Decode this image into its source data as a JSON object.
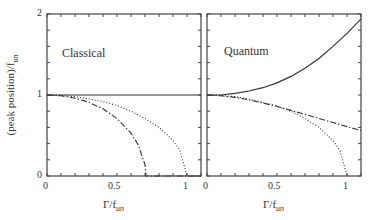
{
  "chart_data": [
    {
      "type": "line",
      "title": "Classical",
      "xlabel": "Γ/f_un",
      "ylabel": "(peak position)/f_un",
      "xlim": [
        0,
        1.1
      ],
      "ylim": [
        0,
        2
      ],
      "xticks": [
        "0",
        "0.5",
        "1"
      ],
      "yticks": [
        "0",
        "1",
        "2"
      ],
      "grid": false,
      "series": [
        {
          "name": "solid",
          "style": "solid",
          "x": [
            0,
            1.1
          ],
          "y": [
            1,
            1
          ]
        },
        {
          "name": "dash-dot",
          "style": "dashdot",
          "x": [
            0,
            0.1,
            0.2,
            0.3,
            0.4,
            0.5,
            0.6,
            0.65,
            0.7,
            0.707,
            1.1
          ],
          "y": [
            1,
            0.99,
            0.96,
            0.91,
            0.83,
            0.71,
            0.53,
            0.39,
            0.14,
            0,
            0
          ]
        },
        {
          "name": "dotted",
          "style": "dotted",
          "x": [
            0,
            0.1,
            0.2,
            0.3,
            0.4,
            0.5,
            0.6,
            0.7,
            0.8,
            0.9,
            0.95,
            1.0,
            1.1
          ],
          "y": [
            1,
            0.995,
            0.98,
            0.95,
            0.92,
            0.87,
            0.8,
            0.71,
            0.6,
            0.44,
            0.31,
            0,
            0
          ]
        }
      ]
    },
    {
      "type": "line",
      "title": "Quantum",
      "xlabel": "Γ/f_un",
      "ylabel": "",
      "xlim": [
        0,
        1.1
      ],
      "ylim": [
        0,
        2
      ],
      "xticks": [
        "0",
        "0.5",
        "1"
      ],
      "yticks": [],
      "grid": false,
      "series": [
        {
          "name": "solid",
          "style": "solid",
          "x": [
            0,
            0.1,
            0.2,
            0.3,
            0.4,
            0.5,
            0.6,
            0.7,
            0.8,
            0.9,
            1.0,
            1.1
          ],
          "y": [
            1,
            1.0,
            1.02,
            1.05,
            1.09,
            1.15,
            1.23,
            1.33,
            1.45,
            1.6,
            1.76,
            1.94
          ]
        },
        {
          "name": "dash-dot",
          "style": "dashdot",
          "x": [
            0,
            0.1,
            0.2,
            0.3,
            0.4,
            0.5,
            0.6,
            0.7,
            0.8,
            0.9,
            1.0,
            1.1
          ],
          "y": [
            1,
            0.99,
            0.97,
            0.94,
            0.9,
            0.86,
            0.81,
            0.76,
            0.71,
            0.66,
            0.61,
            0.56
          ]
        },
        {
          "name": "dotted",
          "style": "dotted",
          "x": [
            0,
            0.1,
            0.2,
            0.3,
            0.4,
            0.5,
            0.6,
            0.7,
            0.8,
            0.9,
            0.95,
            1.0
          ],
          "y": [
            1,
            0.995,
            0.98,
            0.95,
            0.91,
            0.86,
            0.8,
            0.71,
            0.6,
            0.44,
            0.31,
            0
          ]
        }
      ]
    }
  ],
  "labels": {
    "panel_left_title": "Classical",
    "panel_right_title": "Quantum",
    "ylabel_main": "(peak position)/f",
    "ylabel_sub": "un",
    "xlabel_main": "Γ/f",
    "xlabel_sub": "un",
    "ytick_0": "0",
    "ytick_1": "1",
    "ytick_2": "2",
    "xtick_0": "0",
    "xtick_05": "0.5",
    "xtick_1": "1"
  }
}
